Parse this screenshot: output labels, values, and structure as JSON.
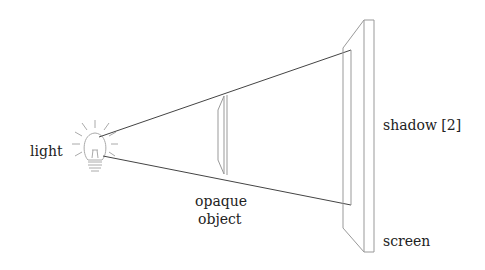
{
  "labels": {
    "light": "light",
    "object_line1": "opaque",
    "object_line2": "object",
    "shadow": "shadow [2]",
    "screen": "screen"
  },
  "colors": {
    "ray": "#444444",
    "outline": "#999999",
    "text": "#222222"
  }
}
